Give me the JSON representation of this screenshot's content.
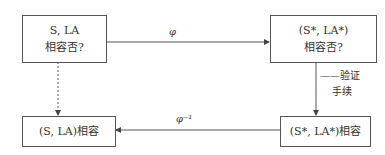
{
  "diagram": {
    "boxes": {
      "top_left": {
        "line1": "S, LA",
        "line2": "相容否?"
      },
      "top_right": {
        "line1": "(S*, LA*)",
        "line2": "相容否?"
      },
      "bottom_left": {
        "line1": "(S, LA)相容"
      },
      "bottom_right": {
        "line1": "(S*, LA*)相容"
      }
    },
    "arrows": {
      "top": {
        "label": "φ",
        "from": "top_left",
        "to": "top_right",
        "style": "solid"
      },
      "bottom": {
        "label": "φ⁻¹",
        "from": "bottom_right",
        "to": "bottom_left",
        "style": "solid"
      },
      "left": {
        "from": "top_left",
        "to": "bottom_left",
        "style": "dashed"
      },
      "right": {
        "from": "top_right",
        "to": "bottom_right",
        "style": "solid",
        "label_line1": "——验证",
        "label_line2": "手续"
      }
    },
    "colors": {
      "line": "#555555",
      "text": "#333333"
    }
  }
}
